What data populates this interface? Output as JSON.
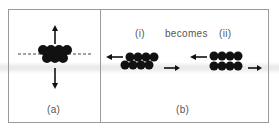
{
  "panels": {
    "a": {
      "label": "(a)",
      "description": "Cluster of atoms straddling a dashed plane, arrows pulling up and down"
    },
    "b": {
      "label": "(b)",
      "sub_i": "(i)",
      "connector": "becomes",
      "sub_ii": "(ii)",
      "description": "Sheared stacked atom layers with opposing arrows"
    }
  },
  "colors": {
    "atom": "#111111",
    "frame": "#9a9a9a",
    "text": "#555555"
  }
}
